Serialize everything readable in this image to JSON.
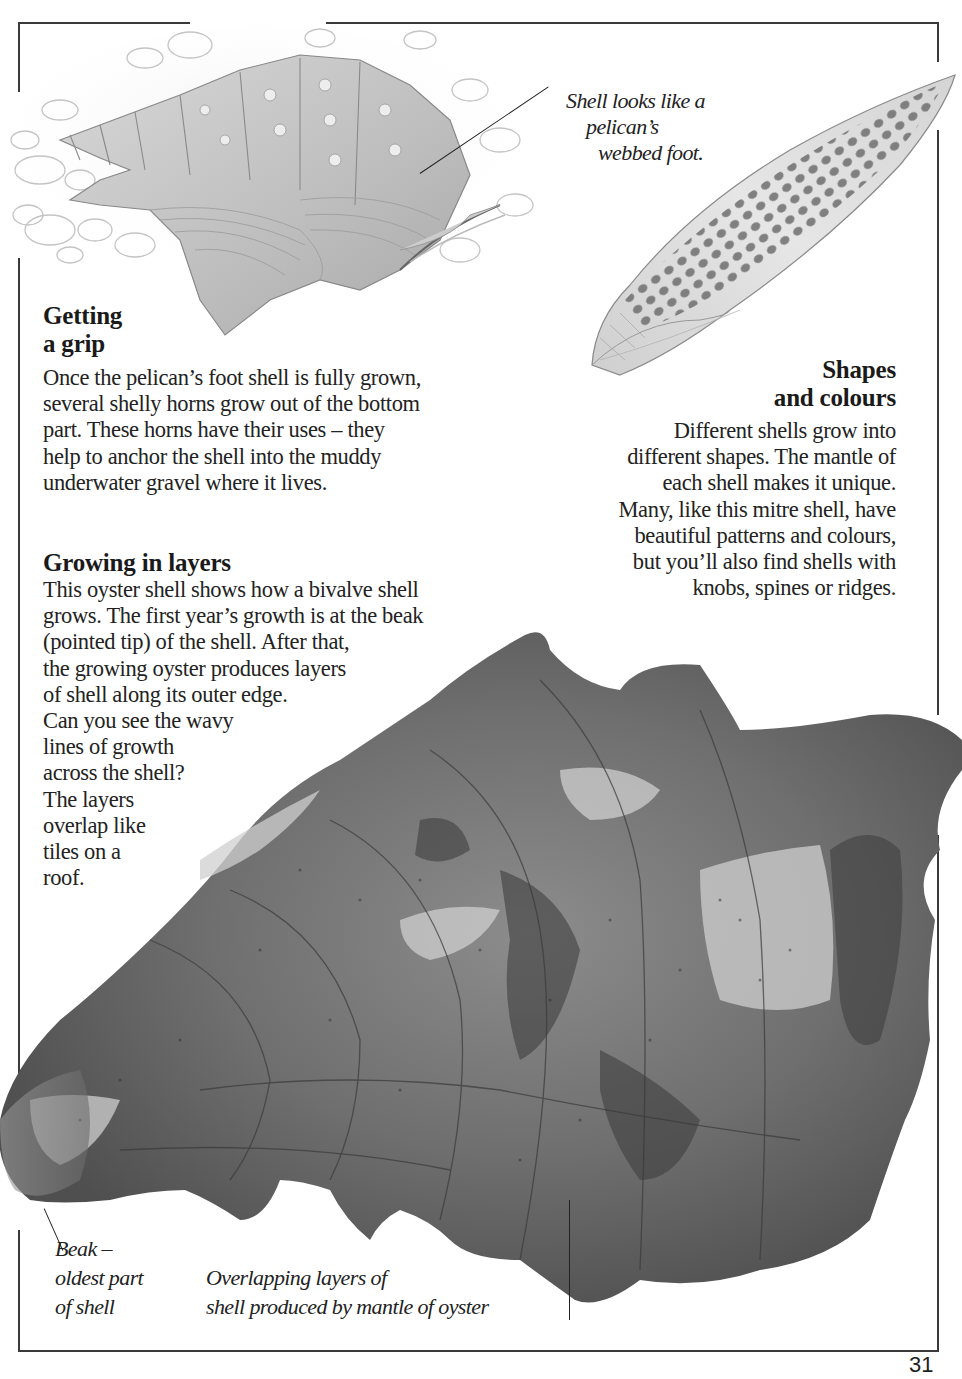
{
  "page": {
    "number": "31",
    "colors": {
      "text": "#1e1e1e",
      "frame": "#3a3a3a",
      "background": "#ffffff"
    }
  },
  "illustrations": {
    "pelican_foot_shell": {
      "label": "pelican's foot shell illustration"
    },
    "mitre_shell": {
      "label": "mitre shell illustration"
    },
    "oyster_shell": {
      "label": "oyster shell photograph"
    }
  },
  "sections": {
    "getting_a_grip": {
      "heading_lines": [
        "Getting",
        "a grip"
      ],
      "body_lines": [
        "Once the pelican’s foot shell is fully grown,",
        "several shelly horns grow out of the bottom",
        "part. These horns have their uses – they",
        "help to anchor the shell into the muddy",
        "underwater gravel where it lives."
      ]
    },
    "shapes_and_colours": {
      "heading_lines": [
        "Shapes",
        "and colours"
      ],
      "body_lines": [
        "Different shells grow into",
        "different shapes. The mantle of",
        "each shell makes it unique.",
        "Many, like this mitre shell, have",
        "beautiful patterns and colours,",
        "but you’ll also find shells with",
        "knobs, spines or ridges."
      ]
    },
    "growing_in_layers": {
      "heading": "Growing in layers",
      "body_lines": [
        "This oyster shell shows how a bivalve shell",
        "grows. The first year’s growth is at the beak",
        "(pointed tip) of the shell. After that,",
        "the growing oyster produces layers",
        "of shell along its outer edge.",
        "Can you see the wavy",
        "lines of growth",
        "across the shell?",
        "The layers",
        "overlap like",
        "tiles on a",
        "roof."
      ]
    }
  },
  "captions": {
    "pelican_foot": [
      "Shell looks like a",
      "pelican’s",
      "webbed foot."
    ],
    "beak": [
      "Beak –",
      "oldest part",
      "of shell"
    ],
    "overlapping_layers": [
      "Overlapping layers of",
      "shell produced by mantle of oyster"
    ]
  }
}
